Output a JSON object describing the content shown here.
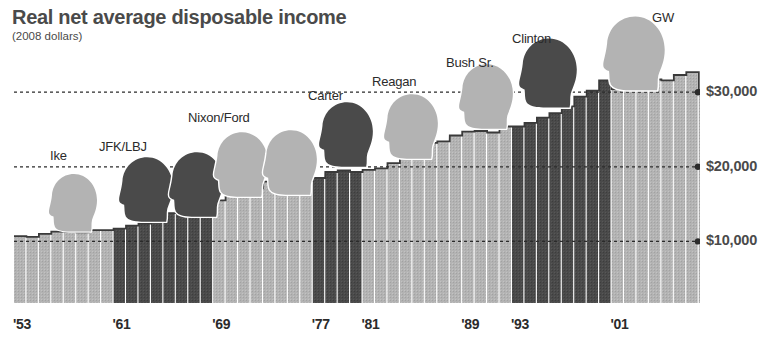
{
  "header": {
    "title": "Real net average disposable income",
    "subtitle": "(2008 dollars)"
  },
  "chart_data": {
    "type": "bar",
    "title": "Real net average disposable income",
    "subtitle": "(2008 dollars)",
    "xlabel": "",
    "ylabel": "",
    "ylim": [
      0,
      34000
    ],
    "grid": true,
    "gridlines": [
      10000,
      20000,
      30000
    ],
    "ytick_labels": [
      "$10,000",
      "$20,000",
      "$30,000"
    ],
    "xtick_labels": [
      "'53",
      "'61",
      "'69",
      "'77",
      "'81",
      "'89",
      "'93",
      "'01"
    ],
    "xtick_years": [
      1953,
      1961,
      1969,
      1977,
      1981,
      1989,
      1993,
      2001
    ],
    "legend_position": "none",
    "bar_color_light": "#b3b3b3",
    "bar_color_dark": "#4a4a4a",
    "outline_color": "#3a3a3a",
    "categories": [
      "1953",
      "1954",
      "1955",
      "1956",
      "1957",
      "1958",
      "1959",
      "1960",
      "1961",
      "1962",
      "1963",
      "1964",
      "1965",
      "1966",
      "1967",
      "1968",
      "1969",
      "1970",
      "1971",
      "1972",
      "1973",
      "1974",
      "1975",
      "1976",
      "1977",
      "1978",
      "1979",
      "1980",
      "1981",
      "1982",
      "1983",
      "1984",
      "1985",
      "1986",
      "1987",
      "1988",
      "1989",
      "1990",
      "1991",
      "1992",
      "1993",
      "1994",
      "1995",
      "1996",
      "1997",
      "1998",
      "1999",
      "2000",
      "2001",
      "2002",
      "2003",
      "2004",
      "2005",
      "2006",
      "2007",
      "2008"
    ],
    "values": [
      10700,
      10600,
      11000,
      11300,
      11300,
      11200,
      11500,
      11500,
      11700,
      12100,
      12400,
      13100,
      13800,
      14200,
      14700,
      15200,
      15500,
      16100,
      16600,
      17100,
      18000,
      17600,
      17800,
      18100,
      18500,
      19300,
      19500,
      19300,
      19600,
      19800,
      20500,
      21900,
      22400,
      23200,
      23400,
      24200,
      24700,
      24800,
      24600,
      25400,
      25400,
      25900,
      26600,
      27200,
      28100,
      29400,
      30200,
      31600,
      30400,
      30500,
      31200,
      31700,
      31600,
      32300,
      32700,
      30300
    ],
    "eras": [
      {
        "name": "Ike",
        "label": "Ike",
        "start_year": 1953,
        "end_year": 1960,
        "shade": "light"
      },
      {
        "name": "JFK/LBJ",
        "label": "JFK/LBJ",
        "start_year": 1961,
        "end_year": 1968,
        "shade": "dark"
      },
      {
        "name": "Nixon/Ford",
        "label": "Nixon/Ford",
        "start_year": 1969,
        "end_year": 1976,
        "shade": "light"
      },
      {
        "name": "Carter",
        "label": "Carter",
        "start_year": 1977,
        "end_year": 1980,
        "shade": "dark"
      },
      {
        "name": "Reagan",
        "label": "Reagan",
        "start_year": 1981,
        "end_year": 1988,
        "shade": "light"
      },
      {
        "name": "Bush Sr.",
        "label": "Bush Sr.",
        "start_year": 1989,
        "end_year": 1992,
        "shade": "light"
      },
      {
        "name": "Clinton",
        "label": "Clinton",
        "start_year": 1993,
        "end_year": 2000,
        "shade": "dark"
      },
      {
        "name": "GW",
        "label": "GW",
        "start_year": 2001,
        "end_year": 2008,
        "shade": "light"
      }
    ]
  },
  "axis": {
    "y_ticks": [
      {
        "label": "$10,000",
        "value": 10000
      },
      {
        "label": "$20,000",
        "value": 20000
      },
      {
        "label": "$30,000",
        "value": 30000
      }
    ],
    "x_ticks": [
      {
        "label": "'53",
        "value": 1953
      },
      {
        "label": "'61",
        "value": 1961
      },
      {
        "label": "'69",
        "value": 1969
      },
      {
        "label": "'77",
        "value": 1977
      },
      {
        "label": "'81",
        "value": 1981
      },
      {
        "label": "'89",
        "value": 1989
      },
      {
        "label": "'93",
        "value": 1993
      },
      {
        "label": "'01",
        "value": 2001
      }
    ]
  },
  "portraits": [
    {
      "name": "Ike",
      "shade": "light"
    },
    {
      "name": "JFK/LBJ",
      "shade": "dark"
    },
    {
      "name": "Nixon/Ford",
      "shade": "light"
    },
    {
      "name": "Carter",
      "shade": "dark"
    },
    {
      "name": "Reagan",
      "shade": "light"
    },
    {
      "name": "Bush Sr.",
      "shade": "light"
    },
    {
      "name": "Clinton",
      "shade": "dark"
    },
    {
      "name": "GW",
      "shade": "light"
    }
  ]
}
